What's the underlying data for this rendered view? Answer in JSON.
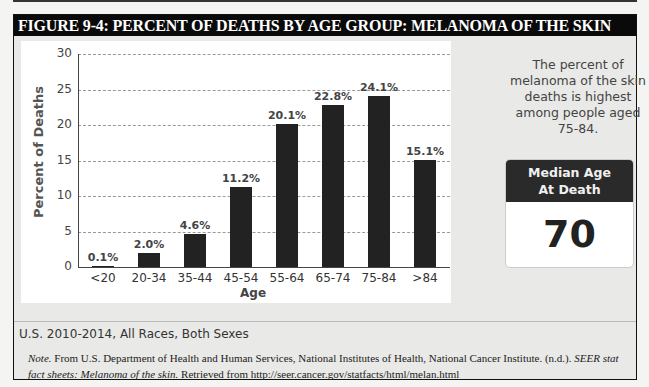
{
  "figure": {
    "title": "FIGURE 9-4: PERCENT OF DEATHS BY AGE GROUP: MELANOMA OF THE SKIN"
  },
  "side_panel": {
    "text": "The percent of melanoma of the skin deaths is highest among people aged 75-84.",
    "median_box": {
      "header_line1": "Median Age",
      "header_line2": "At Death",
      "value": "70"
    }
  },
  "footer": {
    "subtitle": "U.S. 2010-2014, All Races, Both Sexes",
    "note_label": "Note.",
    "note_text_1": " From U.S. Department of Health and Human Services, National Institutes of Health, National Cancer Institute. (n.d.). ",
    "note_italic_1": "SEER stat fact sheets: Melanoma of the skin.",
    "note_text_2": " Retrieved from http://seer.cancer.gov/statfacts/html/melan.html"
  },
  "chart_data": {
    "type": "bar",
    "title": "Percent of Deaths by Age Group: Melanoma of the Skin",
    "xlabel": "Age",
    "ylabel": "Percent of Deaths",
    "categories": [
      "<20",
      "20-34",
      "35-44",
      "45-54",
      "55-64",
      "65-74",
      "75-84",
      ">84"
    ],
    "values": [
      0.1,
      2.0,
      4.6,
      11.2,
      20.1,
      22.8,
      24.1,
      15.1
    ],
    "value_labels": [
      "0.1%",
      "2.0%",
      "4.6%",
      "11.2%",
      "20.1%",
      "22.8%",
      "24.1%",
      "15.1%"
    ],
    "ylim": [
      0,
      30
    ],
    "yticks": [
      0,
      5,
      10,
      15,
      20,
      25,
      30
    ],
    "grid": "horizontal dashed",
    "legend": "none",
    "bar_color": "#222222"
  }
}
